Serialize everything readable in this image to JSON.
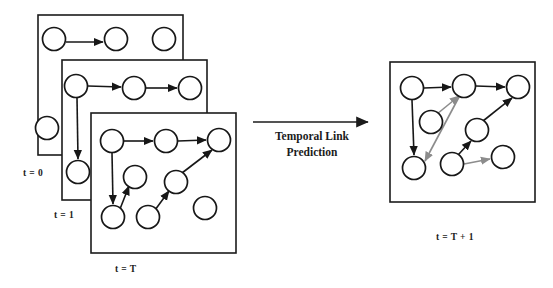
{
  "figure": {
    "background_color": "#ffffff",
    "node_stroke_color": "#171717",
    "existing_edge_color": "#171717",
    "predicted_edge_color": "#8c8c8c"
  },
  "transition": {
    "label_line1": "Temporal Link",
    "label_line2": "Prediction",
    "arrow_name": "temporal-link-prediction-arrow"
  },
  "panels": [
    {
      "id": "t0",
      "label": "t = 0",
      "node_count": 4,
      "edge_count": 1,
      "nodes": [
        {
          "id": "n1",
          "cx": 54,
          "cy": 39
        },
        {
          "id": "n2",
          "cx": 116,
          "cy": 39
        },
        {
          "id": "n3",
          "cx": 164,
          "cy": 39
        },
        {
          "id": "n4",
          "cx": 47,
          "cy": 128
        }
      ],
      "edges": [
        {
          "from": "n1",
          "to": "n2",
          "kind": "existing"
        }
      ]
    },
    {
      "id": "t1",
      "label": "t = 1",
      "node_count": 5,
      "edge_count": 3,
      "nodes": [
        {
          "id": "n1",
          "cx": 76,
          "cy": 86
        },
        {
          "id": "n2",
          "cx": 134,
          "cy": 88
        },
        {
          "id": "n3",
          "cx": 190,
          "cy": 88
        },
        {
          "id": "n4",
          "cx": 78,
          "cy": 172
        },
        {
          "id": "n5",
          "cx": 47,
          "cy": 128
        }
      ],
      "edges": [
        {
          "from": "n1",
          "to": "n2",
          "kind": "existing"
        },
        {
          "from": "n2",
          "to": "n3",
          "kind": "existing"
        },
        {
          "from": "n1",
          "to": "n4",
          "kind": "existing"
        }
      ]
    },
    {
      "id": "tT",
      "label": "t = T",
      "node_count": 8,
      "edge_count": 5,
      "nodes": [
        {
          "id": "n1",
          "cx": 112,
          "cy": 141
        },
        {
          "id": "n2",
          "cx": 166,
          "cy": 141
        },
        {
          "id": "n3",
          "cx": 219,
          "cy": 140
        },
        {
          "id": "n4",
          "cx": 135,
          "cy": 177
        },
        {
          "id": "n5",
          "cx": 176,
          "cy": 182
        },
        {
          "id": "n6",
          "cx": 113,
          "cy": 217
        },
        {
          "id": "n7",
          "cx": 148,
          "cy": 217
        },
        {
          "id": "n8",
          "cx": 205,
          "cy": 208
        }
      ],
      "edges": [
        {
          "from": "n1",
          "to": "n2",
          "kind": "existing"
        },
        {
          "from": "n2",
          "to": "n3",
          "kind": "existing"
        },
        {
          "from": "n1",
          "to": "n6",
          "kind": "existing"
        },
        {
          "from": "n6",
          "to": "n4",
          "kind": "existing"
        },
        {
          "from": "n7",
          "to": "n5",
          "kind": "existing"
        },
        {
          "from": "n5",
          "to": "n3",
          "kind": "existing"
        }
      ]
    },
    {
      "id": "tT1",
      "label": "t = T + 1",
      "node_count": 8,
      "edge_count": 8,
      "nodes": [
        {
          "id": "n1",
          "cx": 412,
          "cy": 88
        },
        {
          "id": "n2",
          "cx": 464,
          "cy": 86
        },
        {
          "id": "n3",
          "cx": 518,
          "cy": 87
        },
        {
          "id": "n4",
          "cx": 431,
          "cy": 122
        },
        {
          "id": "n5",
          "cx": 477,
          "cy": 130
        },
        {
          "id": "n6",
          "cx": 414,
          "cy": 168
        },
        {
          "id": "n7",
          "cx": 452,
          "cy": 164
        },
        {
          "id": "n8",
          "cx": 503,
          "cy": 157
        }
      ],
      "edges": [
        {
          "from": "n1",
          "to": "n2",
          "kind": "existing"
        },
        {
          "from": "n2",
          "to": "n3",
          "kind": "existing"
        },
        {
          "from": "n1",
          "to": "n6",
          "kind": "existing"
        },
        {
          "from": "n7",
          "to": "n5",
          "kind": "existing"
        },
        {
          "from": "n5",
          "to": "n3",
          "kind": "existing"
        },
        {
          "from": "n4",
          "to": "n2",
          "kind": "predicted"
        },
        {
          "from": "n2",
          "to": "n6",
          "kind": "predicted"
        },
        {
          "from": "n7",
          "to": "n8",
          "kind": "predicted"
        }
      ]
    }
  ]
}
